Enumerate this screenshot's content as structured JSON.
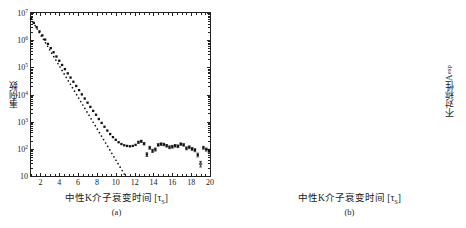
{
  "figure": {
    "panels": [
      {
        "id": "a",
        "caption": "(a)",
        "ylabel": "事例数",
        "xlabel_text": "中性K介子衰变时间 [",
        "xlabel_sub_base": "τ",
        "xlabel_sub": "S",
        "xlabel_tail": "]"
      },
      {
        "id": "b",
        "caption": "(b)",
        "ylabel_base": "不对称性A",
        "ylabel_sup": "exp",
        "xlabel_text": "中性K介子衰变时间 [",
        "xlabel_sub_base": "τ",
        "xlabel_sub": "S",
        "xlabel_tail": "]"
      }
    ]
  },
  "chart_data": [
    {
      "type": "scatter",
      "panel": "a",
      "title": "",
      "xlabel": "中性K介子衰变时间 [τS]",
      "ylabel": "事例数",
      "xlim": [
        1,
        20
      ],
      "ylim_log": [
        10,
        10000000
      ],
      "yscale": "log",
      "xscale": "linear",
      "grid": false,
      "legend": "none",
      "xticks": [
        2,
        4,
        6,
        8,
        10,
        12,
        14,
        16,
        18,
        20
      ],
      "xtick_labels": [
        "2",
        "4",
        "6",
        "8",
        "10",
        "12",
        "14",
        "16",
        "18",
        "20"
      ],
      "yticks": [
        10,
        100,
        1000,
        10000,
        100000,
        1000000,
        10000000
      ],
      "ytick_labels": [
        "10",
        "10^2",
        "10^3",
        "10^4",
        "10^5",
        "10^6",
        "10^7"
      ],
      "series": [
        {
          "name": "measured-events",
          "marker": "filled-square",
          "x": [
            1.0,
            1.3,
            1.6,
            1.9,
            2.2,
            2.5,
            2.8,
            3.1,
            3.4,
            3.7,
            4.0,
            4.3,
            4.6,
            4.9,
            5.2,
            5.5,
            5.8,
            6.1,
            6.4,
            6.7,
            7.0,
            7.3,
            7.6,
            7.9,
            8.2,
            8.5,
            8.8,
            9.1,
            9.4,
            9.7,
            10.0,
            10.3,
            10.6,
            10.9,
            11.2,
            11.5,
            11.8,
            12.1,
            12.4,
            12.7,
            13.0,
            13.3,
            13.6,
            13.9,
            14.2,
            14.5,
            14.8,
            15.1,
            15.4,
            15.7,
            16.0,
            16.3,
            16.6,
            16.9,
            17.2,
            17.5,
            17.8,
            18.1,
            18.4,
            18.7,
            19.0,
            19.3,
            19.6,
            19.9
          ],
          "y": [
            6200000,
            4300000,
            3000000,
            2100000,
            1500000,
            1050000,
            730000,
            510000,
            360000,
            250000,
            175000,
            122000,
            86000,
            60000,
            42000,
            29500,
            20600,
            14500,
            10100,
            7100,
            5000,
            3500,
            2500,
            1800,
            1250,
            900,
            650,
            470,
            350,
            270,
            215,
            175,
            150,
            135,
            128,
            124,
            128,
            140,
            175,
            190,
            155,
            62,
            110,
            85,
            95,
            140,
            150,
            145,
            130,
            115,
            120,
            130,
            125,
            150,
            140,
            105,
            115,
            100,
            90,
            60,
            28,
            110,
            95,
            85
          ],
          "yerr_relative_tail": true
        },
        {
          "name": "short-lived-component-fit",
          "marker": "dotted-line",
          "x": [
            1.0,
            3.0,
            5.0,
            7.0,
            9.0,
            11.0,
            12.0,
            12.5
          ],
          "y": [
            6200000,
            430000,
            30000,
            2100,
            148,
            10.3,
            2.7,
            1.4
          ],
          "note": "pure exponential extrapolation diverging below data after t≈11"
        }
      ]
    },
    {
      "type": "scatter",
      "panel": "b",
      "title": "",
      "xlabel": "中性K介子衰变时间 [τS]",
      "ylabel": "不对称性A^exp",
      "xlim": [
        1,
        20
      ],
      "ylim": [
        -0.5,
        0.5
      ],
      "grid": false,
      "legend": "none",
      "xticks": [
        2,
        4,
        6,
        8,
        10,
        12,
        14,
        16,
        18,
        20
      ],
      "xtick_labels": [
        "2",
        "4",
        "6",
        "8",
        "10",
        "12",
        "14",
        "16",
        "18",
        "20"
      ],
      "yticks": [
        0.5,
        0.4,
        0.3,
        0.2,
        0.1,
        0,
        -0.1,
        -0.2,
        -0.3,
        -0.4,
        -0.5
      ],
      "ytick_labels": [
        "0.5",
        "0.4",
        "0.3",
        "0.2",
        "0.1",
        "0",
        "-0.1",
        "-0.2",
        "-0.3",
        "-0.4",
        "-0.5"
      ],
      "series": [
        {
          "name": "asymmetry-data",
          "marker": "point-with-errorbars",
          "x": [
            1.2,
            1.8,
            2.4,
            3.0,
            3.6,
            4.2,
            4.8,
            5.4,
            6.0,
            6.4,
            6.8,
            7.2,
            7.6,
            8.0,
            8.4,
            8.8,
            9.2,
            9.6,
            10.0,
            10.4,
            10.8,
            11.2,
            11.6,
            12.0,
            12.4,
            12.8,
            13.2,
            13.6,
            14.0,
            14.4,
            14.8,
            15.2,
            15.6,
            16.0,
            16.4,
            16.8,
            17.2,
            17.6,
            18.0,
            18.4,
            18.8,
            19.2,
            19.6,
            20.0
          ],
          "y": [
            0.005,
            0.005,
            0.005,
            0.005,
            0.01,
            0.02,
            0.04,
            0.07,
            0.11,
            0.135,
            0.165,
            0.2,
            0.235,
            0.27,
            0.295,
            0.315,
            0.325,
            0.335,
            0.3,
            0.31,
            0.195,
            0.21,
            0.155,
            0.03,
            0.06,
            -0.175,
            -0.29,
            -0.335,
            -0.225,
            -0.3,
            -0.125,
            -0.12,
            0.03,
            -0.115,
            -0.105,
            -0.185,
            -0.02,
            0.035,
            0.16,
            -0.055,
            0.13,
            0.12,
            0.04,
            0.015
          ],
          "yerr": [
            0.005,
            0.005,
            0.005,
            0.006,
            0.006,
            0.007,
            0.008,
            0.009,
            0.01,
            0.011,
            0.012,
            0.013,
            0.014,
            0.015,
            0.016,
            0.018,
            0.02,
            0.022,
            0.025,
            0.028,
            0.035,
            0.04,
            0.05,
            0.055,
            0.06,
            0.065,
            0.07,
            0.075,
            0.08,
            0.085,
            0.09,
            0.1,
            0.11,
            0.1,
            0.11,
            0.115,
            0.12,
            0.13,
            0.16,
            0.14,
            0.17,
            0.18,
            0.17,
            0.16
          ]
        },
        {
          "name": "fit-curve",
          "marker": "solid-line",
          "x": [
            1.0,
            2.0,
            3.0,
            4.0,
            5.0,
            6.0,
            7.0,
            8.0,
            9.0,
            9.6,
            10.0,
            11.0,
            12.0,
            13.0,
            13.8,
            14.5,
            15.5,
            16.5,
            17.5,
            18.5,
            19.2,
            20.0
          ],
          "y": [
            0.005,
            0.005,
            0.005,
            0.015,
            0.045,
            0.105,
            0.195,
            0.275,
            0.325,
            0.33,
            0.315,
            0.225,
            0.065,
            -0.195,
            -0.295,
            -0.28,
            -0.185,
            -0.085,
            0.0,
            0.04,
            0.05,
            0.045
          ]
        }
      ]
    }
  ]
}
